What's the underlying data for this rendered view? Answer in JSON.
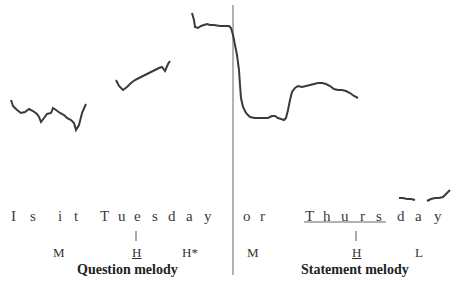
{
  "figure": {
    "sentence_letters_question": [
      "I",
      "s",
      "i",
      "t",
      "T",
      "u",
      "e",
      "s",
      "d",
      "a",
      "y"
    ],
    "sentence_letters_statement": [
      "o",
      "r",
      "T",
      "h",
      "u",
      "r",
      "s",
      "d",
      "a",
      "y"
    ],
    "question": {
      "words": [
        "Is",
        "it",
        "Tuesday"
      ],
      "tones": [
        {
          "label": "M",
          "underlined": false
        },
        {
          "label": "H",
          "underlined": true
        },
        {
          "label": "H*",
          "underlined": false
        }
      ],
      "caption": "Question melody"
    },
    "statement": {
      "words": [
        "or",
        "Thursday"
      ],
      "stressed_syllable": "Thurs",
      "tones": [
        {
          "label": "M",
          "underlined": false
        },
        {
          "label": "H",
          "underlined": true
        },
        {
          "label": "L",
          "underlined": false
        }
      ],
      "caption": "Statement melody"
    },
    "colors": {
      "pitch_line": "#3a3a3a",
      "divider": "#555555",
      "text": "#3a3a3a"
    }
  }
}
